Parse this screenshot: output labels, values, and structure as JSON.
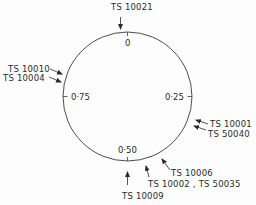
{
  "diagram": {
    "type": "phase-circle",
    "circle": {
      "cx": 127.5,
      "cy": 96.5,
      "r": 64.5,
      "stroke": "#3a3a3a"
    },
    "phase_ticks": [
      {
        "label": "0",
        "phase": 0
      },
      {
        "label": "0·25",
        "phase": 0.25
      },
      {
        "label": "0·50",
        "phase": 0.5
      },
      {
        "label": "0·75",
        "phase": 0.75
      }
    ],
    "markers": [
      {
        "label": "TS 10021"
      },
      {
        "label": "TS 10010"
      },
      {
        "label": "TS 10004"
      },
      {
        "label": "TS 10001"
      },
      {
        "label": "TS 50040"
      },
      {
        "label": "TS 10006"
      },
      {
        "label": "TS 10002 , TS 50035"
      },
      {
        "label": "TS 10009"
      }
    ]
  }
}
